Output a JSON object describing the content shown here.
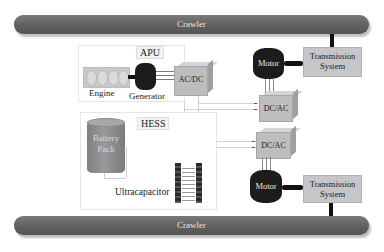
{
  "diagram": {
    "crawler_top": {
      "label": "Crawler"
    },
    "crawler_bottom": {
      "label": "Crawler"
    },
    "apu": {
      "title": "APU",
      "engine_label": "Engine",
      "generator_label": "Generator",
      "converter_label": "AC/DC"
    },
    "hess": {
      "title": "HESS",
      "battery_label_line1": "Battery",
      "battery_label_line2": "Pack",
      "ultracap_label": "Ultracapacitor"
    },
    "drive_top": {
      "motor_label": "Motor",
      "transmission_line1": "Transmission",
      "transmission_line2": "System",
      "inverter_label": "DC/AC"
    },
    "drive_bottom": {
      "motor_label": "Motor",
      "transmission_line1": "Transmission",
      "transmission_line2": "System",
      "inverter_label": "DC/AC"
    },
    "colors": {
      "crawler": "#666666",
      "motor": "#1c1c1c",
      "converter": "#bdbdbd",
      "transmission": "#c6c6c6",
      "battery": "#8c8c8c"
    }
  }
}
